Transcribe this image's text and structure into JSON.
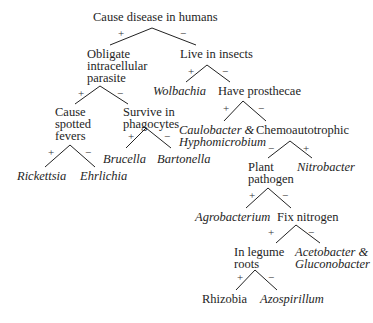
{
  "diagram": {
    "type": "decision-tree",
    "root": "Cause disease in humans",
    "nodes": {
      "root": "Cause disease in humans",
      "obligate_line1": "Obligate",
      "obligate_line2": "intracellular",
      "obligate_line3": "parasite",
      "live_insects": "Live in insects",
      "spotted_line1": "Cause",
      "spotted_line2": "spotted",
      "spotted_line3": "fevers",
      "phago_line1": "Survive in",
      "phago_line2": "phagocytes",
      "wolbachia": "Wolbachia",
      "prosthecae": "Have prosthecae",
      "rickettsia": "Rickettsia",
      "ehrlichia": "Ehrlichia",
      "brucella": "Brucella",
      "bartonella": "Bartonella",
      "caulo_line1": "Caulobacter &",
      "caulo_line2": "Hyphomicrobium",
      "chemo": "Chemoautotrophic",
      "plant_line1": "Plant",
      "plant_line2": "pathogen",
      "nitrobacter": "Nitrobacter",
      "agrobacterium": "Agrobacterium",
      "fix_nitrogen": "Fix nitrogen",
      "legume_line1": "In legume",
      "legume_line2": "roots",
      "aceto_line1": "Acetobacter &",
      "aceto_line2": "Gluconobacter",
      "rhizobia": "Rhizobia",
      "azospirillum": "Azospirillum"
    },
    "signs": {
      "plus": "+",
      "minus": "−"
    }
  }
}
